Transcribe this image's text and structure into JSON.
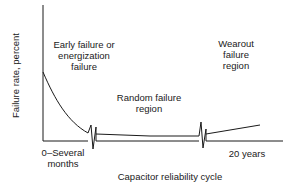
{
  "diagram": {
    "type": "bathtub-curve",
    "y_axis_label": "Failure rate, percent",
    "x_axis_label": "Capacitor reliability cycle",
    "regions": [
      {
        "id": "early",
        "lines": [
          "Early failure or",
          "energization",
          "failure"
        ]
      },
      {
        "id": "random",
        "lines": [
          "Random failure",
          "region"
        ]
      },
      {
        "id": "wearout",
        "lines": [
          "Wearout",
          "failure",
          "region"
        ]
      }
    ],
    "x_ticks": [
      {
        "lines": [
          "0–Several",
          "months"
        ]
      },
      {
        "lines": [
          "20 years"
        ]
      }
    ],
    "colors": {
      "line": "#1a1a1a",
      "background": "#ffffff"
    }
  }
}
